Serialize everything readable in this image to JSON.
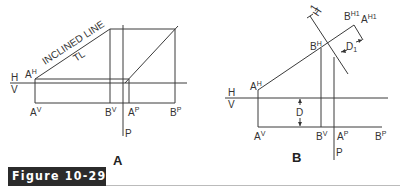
{
  "figure": {
    "label": "Figure 10-29",
    "label_bg": "#2b2b2b",
    "label_color": "#ffffff"
  },
  "panel_a": {
    "caption": "A",
    "annotation_line1": "INCLINED LINE",
    "annotation_line2": "TL",
    "labels": {
      "a_h": "A",
      "a_h_sup": "H",
      "h": "H",
      "v": "V",
      "a_v": "A",
      "a_v_sup": "V",
      "b_v": "B",
      "b_v_sup": "V",
      "a_p": "A",
      "a_p_sup": "P",
      "b_p": "B",
      "b_p_sup": "P",
      "p": "P"
    }
  },
  "panel_b": {
    "caption": "B",
    "labels": {
      "a_h": "A",
      "a_h_sup": "H",
      "b_h": "B",
      "b_h_sup": "H",
      "b_h1": "B",
      "b_h1_sup": "H1",
      "a_h1": "A",
      "a_h1_sup": "H1",
      "fold_h": "H",
      "fold_1": "1",
      "d1": "D",
      "d1_sub": "1",
      "d": "D",
      "h": "H",
      "v": "V",
      "a_v": "A",
      "a_v_sup": "V",
      "b_v": "B",
      "b_v_sup": "V",
      "a_p": "A",
      "a_p_sup": "P",
      "b_p": "B",
      "b_p_sup": "P",
      "p": "P"
    }
  }
}
